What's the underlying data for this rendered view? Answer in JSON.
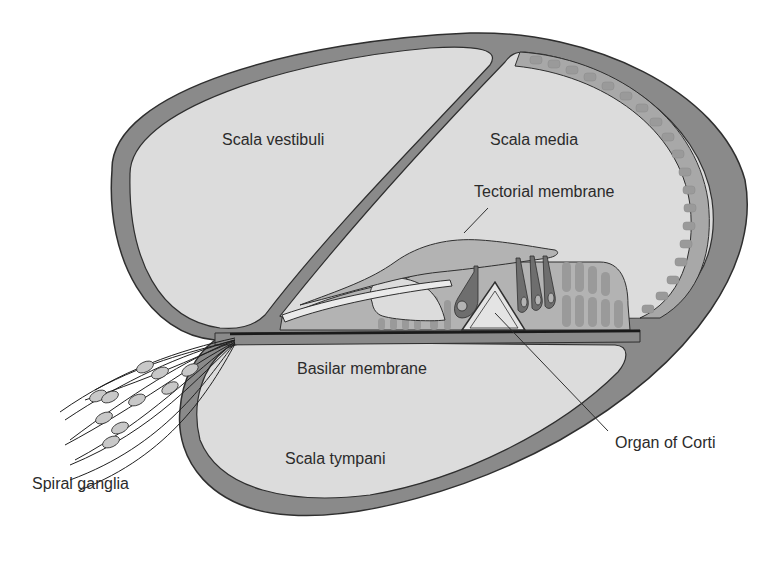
{
  "colors": {
    "bone": "#8a8a8a",
    "fluid": "#dcdcdc",
    "tissue": "#b3b3b3",
    "cells": "#9a9a9a",
    "hair_cell": "#6e6e6e",
    "outline": "#2f2f2f",
    "text": "#2b2b2b"
  },
  "labels": {
    "scala_vestibuli": "Scala vestibuli",
    "scala_media": "Scala media",
    "tectorial_membrane": "Tectorial membrane",
    "basilar_membrane": "Basilar membrane",
    "organ_of_corti": "Organ of Corti",
    "scala_tympani": "Scala tympani",
    "spiral_ganglia": "Spiral ganglia"
  }
}
